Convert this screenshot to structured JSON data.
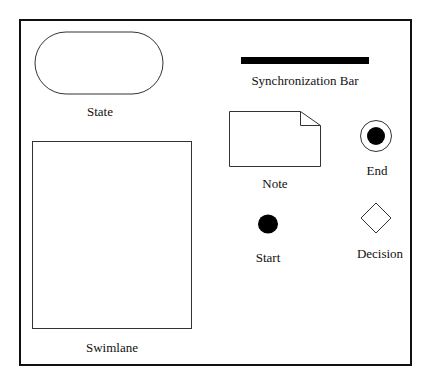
{
  "palette": {
    "title": "",
    "shapes": [
      {
        "id": "state",
        "label": "State",
        "type": "rounded-rectangle"
      },
      {
        "id": "synchronization-bar",
        "label": "Synchronization Bar",
        "type": "bar"
      },
      {
        "id": "note",
        "label": "Note",
        "type": "note"
      },
      {
        "id": "end",
        "label": "End",
        "type": "end-node"
      },
      {
        "id": "start",
        "label": "Start",
        "type": "start-node"
      },
      {
        "id": "decision",
        "label": "Decision",
        "type": "diamond"
      },
      {
        "id": "swimlane",
        "label": "Swimlane",
        "type": "rectangle"
      }
    ]
  },
  "colors": {
    "stroke": "#333333",
    "fill": "#ffffff",
    "solid": "#000000",
    "frame": "#111111"
  }
}
